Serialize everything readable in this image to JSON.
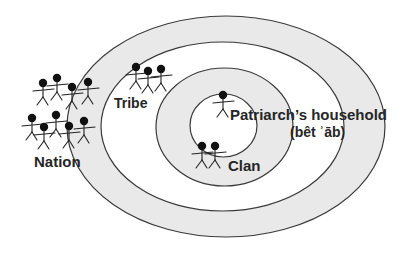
{
  "diagram": {
    "rings": [
      {
        "id": "nation-ring",
        "label": "Nation",
        "fill": "#e9e9e9"
      },
      {
        "id": "tribe-ring",
        "label": "Tribe",
        "fill": "#ffffff"
      },
      {
        "id": "clan-ring",
        "label": "Clan",
        "fill": "#e9e9e9"
      },
      {
        "id": "household-ring",
        "label": "Patriarch’s household",
        "fill": "#ffffff"
      }
    ],
    "labels": {
      "nation": "Nation",
      "tribe": "Tribe",
      "clan": "Clan",
      "household": "Patriarch’s household",
      "household_transliteration": "(bêt ʾāb)"
    },
    "figure_groups": {
      "nation": {
        "count": 9
      },
      "tribe": {
        "count": 3
      },
      "clan": {
        "count": 2
      },
      "household": {
        "count": 1
      }
    },
    "colors": {
      "band_gray": "#e9e9e9",
      "band_white": "#ffffff",
      "outline": "#3a3a3a",
      "figure": "#111111",
      "text": "#262626"
    }
  }
}
